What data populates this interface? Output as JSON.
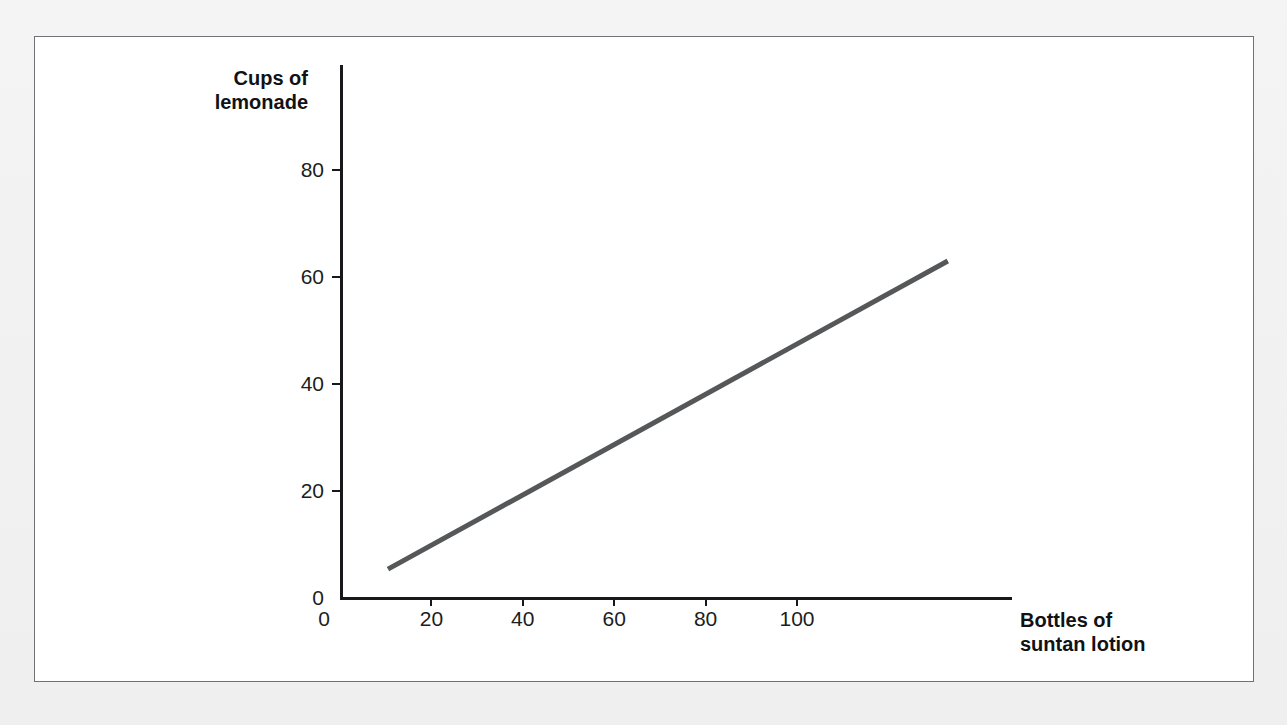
{
  "figure": {
    "background_color": "#ffffff",
    "page_color": "#f2f2f3",
    "border_color": "#6f7176"
  },
  "chart_data": {
    "type": "line",
    "title": "",
    "subtitle": "",
    "xlabel": "Bottles of\nsuntan lotion",
    "ylabel": "Cups of\nlemonade",
    "x_ticks": [
      0,
      20,
      40,
      60,
      80,
      100
    ],
    "y_ticks": [
      0,
      20,
      40,
      60,
      80
    ],
    "x_tick_labels": [
      "0",
      "20",
      "40",
      "60",
      "80",
      "100"
    ],
    "y_tick_labels": [
      "0",
      "20",
      "40",
      "60",
      "80"
    ],
    "xlim": [
      0,
      147
    ],
    "ylim": [
      0,
      99
    ],
    "grid": false,
    "legend": null,
    "series": [
      {
        "name": "trend line",
        "color": "#555759",
        "line_width": 5,
        "x": [
          10.5,
          133.0
        ],
        "values": [
          5.4,
          63.0
        ]
      }
    ],
    "annotations": []
  },
  "axes": {
    "y_title": "Cups of\nlemonade",
    "x_title": "Bottles of\nsuntan lotion",
    "tick_color": "#16181c",
    "label_color": "#1b1d21"
  }
}
